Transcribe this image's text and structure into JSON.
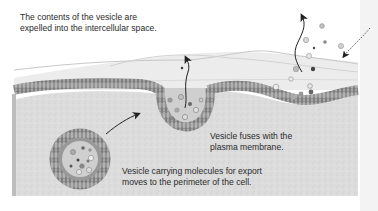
{
  "diagram": {
    "labels": {
      "expelled": {
        "line1": "The contents of the vesicle are",
        "line2": "expelled into the intercellular space."
      },
      "fuses": {
        "line1": "Vesicle fuses with the",
        "line2": "plasma membrane."
      },
      "carrying": {
        "line1": "Vesicle carrying molecules for export",
        "line2": "moves to the perimeter of the cell."
      }
    },
    "stages": [
      {
        "step": 1,
        "name": "transport-vesicle",
        "description": "Vesicle carrying molecules for export moves to the perimeter of the cell."
      },
      {
        "step": 2,
        "name": "membrane-fusion",
        "description": "Vesicle fuses with the plasma membrane."
      },
      {
        "step": 3,
        "name": "release",
        "description": "The contents of the vesicle are expelled into the intercellular space."
      }
    ],
    "colors": {
      "cytoplasm": "#dcdcdc",
      "membrane_head": "#8a8a8a",
      "membrane_tail": "#bdbdbd",
      "extracellular_layer": "#e9e9e9",
      "vesicle_lumen": "#cfcfcf",
      "arrow": "#333333",
      "text": "#2a2a2a"
    }
  }
}
